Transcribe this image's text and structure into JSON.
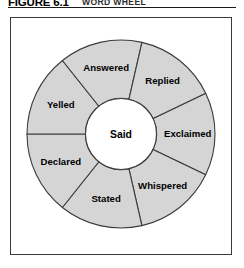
{
  "figure": {
    "number": "FIGURE 6.1",
    "caption": "WORD WHEEL"
  },
  "wheel": {
    "hub_label": "Said",
    "segments": [
      {
        "label": "Exclaimed"
      },
      {
        "label": "Whispered"
      },
      {
        "label": "Stated"
      },
      {
        "label": "Declared"
      },
      {
        "label": "Yelled"
      },
      {
        "label": "Answered"
      },
      {
        "label": "Replied"
      }
    ],
    "colors": {
      "segment_fill": "#d5d5d5",
      "segment_stroke": "#3b3b3b",
      "hub_fill": "#ffffff",
      "panel_border": "#3a3a3a",
      "text": "#000000"
    }
  },
  "chart_data": {
    "type": "pie",
    "title": "WORD WHEEL",
    "center_label": "Said",
    "categories": [
      "Exclaimed",
      "Whispered",
      "Stated",
      "Declared",
      "Yelled",
      "Answered",
      "Replied"
    ],
    "values": [
      1,
      1,
      1,
      1,
      1,
      1,
      1
    ],
    "segment_count": 7,
    "equal_segments": true,
    "donut": true,
    "inner_radius_ratio": 0.38,
    "start_angle_deg": -25.7,
    "legend": "none",
    "grid": false,
    "xlabel": "",
    "ylabel": ""
  }
}
